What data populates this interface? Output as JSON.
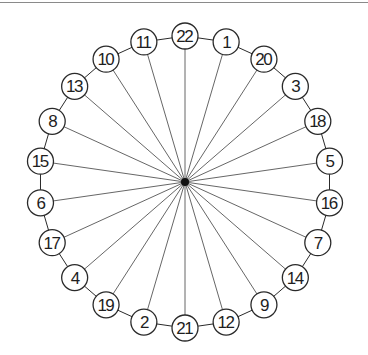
{
  "diagram": {
    "type": "star-ring-graph",
    "center": {
      "x": 185,
      "y": 182
    },
    "ring_radius": 146,
    "node_radius": 13,
    "hub_color": "#111111",
    "stroke_color": "#2a2a2a",
    "spoke_color": "#555555",
    "nodes_clockwise_from_top": [
      "22",
      "1",
      "20",
      "3",
      "18",
      "5",
      "16",
      "7",
      "14",
      "9",
      "12",
      "21",
      "2",
      "19",
      "4",
      "17",
      "6",
      "15",
      "8",
      "13",
      "10",
      "11"
    ],
    "edges": {
      "spokes": "hub-to-every-node",
      "ring": "each-node-to-adjacent-node"
    }
  }
}
